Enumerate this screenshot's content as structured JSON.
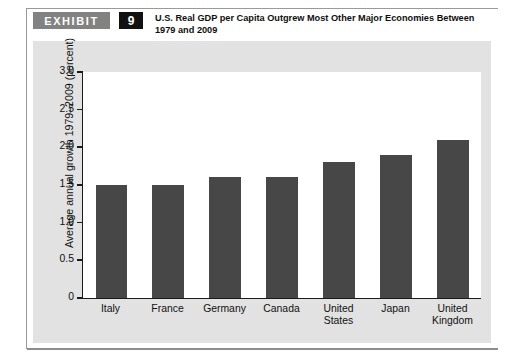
{
  "exhibit": {
    "badge_label": "EXHIBIT",
    "number": "9",
    "title": "U.S. Real GDP per Capita Outgrew Most Other Major Economies Between 1979 and 2009"
  },
  "colors": {
    "bar": "#474747",
    "badge_background": "#828282",
    "number_background": "#111111",
    "panel_background": "#e2e2e2",
    "plot_background": "#ffffff",
    "axis": "#1b1b1b"
  },
  "chart_data": {
    "type": "bar",
    "title": "U.S. Real GDP per Capita Outgrew Most Other Major Economies Between 1979 and 2009",
    "xlabel": "",
    "ylabel": "Average annual growth 1979–2009 (percent)",
    "categories": [
      "Italy",
      "France",
      "Germany",
      "Canada",
      "United States",
      "Japan",
      "United Kingdom"
    ],
    "values": [
      1.5,
      1.5,
      1.6,
      1.6,
      1.8,
      1.9,
      2.1
    ],
    "ylim": [
      0,
      3.0
    ],
    "ytick_values": [
      3.0,
      2.5,
      2.0,
      1.5,
      1.0,
      0.5,
      0
    ],
    "ytick_labels": [
      "3.0",
      "2.5",
      "2.0",
      "1.5",
      "1.0",
      "0.5",
      "0"
    ],
    "grid": false,
    "legend": false
  }
}
